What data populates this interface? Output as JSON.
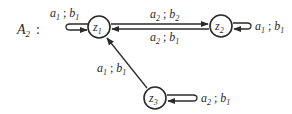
{
  "automaton": {
    "name": "A",
    "name_sub": "2",
    "colon": ":"
  },
  "nodes": [
    {
      "id": "z1",
      "base": "z",
      "sub": "1"
    },
    {
      "id": "z2",
      "base": "z",
      "sub": "2"
    },
    {
      "id": "z3",
      "base": "z",
      "sub": "3"
    }
  ],
  "edges": [
    {
      "from": "z1",
      "to": "z1",
      "a": "a",
      "a_sub": "1",
      "sep": " ; ",
      "b": "b",
      "b_sub": "1"
    },
    {
      "from": "z1",
      "to": "z2",
      "a": "a",
      "a_sub": "2",
      "sep": " ; ",
      "b": "b",
      "b_sub": "2"
    },
    {
      "from": "z2",
      "to": "z1",
      "a": "a",
      "a_sub": "2",
      "sep": " ; ",
      "b": "b",
      "b_sub": "1"
    },
    {
      "from": "z2",
      "to": "z2",
      "a": "a",
      "a_sub": "1",
      "sep": " ; ",
      "b": "b",
      "b_sub": "1"
    },
    {
      "from": "z3",
      "to": "z1",
      "a": "a",
      "a_sub": "1",
      "sep": " ; ",
      "b": "b",
      "b_sub": "1"
    },
    {
      "from": "z3",
      "to": "z3",
      "a": "a",
      "a_sub": "2",
      "sep": " ; ",
      "b": "b",
      "b_sub": "1"
    }
  ]
}
